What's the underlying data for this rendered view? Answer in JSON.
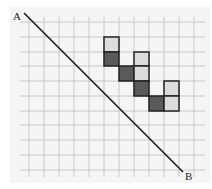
{
  "diagram": {
    "type": "grid-line-rasterization",
    "labels": {
      "start": "A",
      "end": "B"
    },
    "colors": {
      "background": "#ffffff",
      "panel": "#f5f5f5",
      "grid": "#c8c8c8",
      "line": "#1a1a1a",
      "cell_border": "#222222",
      "dark_cell": "#5a5a5a",
      "light_cell": "#dcdcdc"
    },
    "grid": {
      "x_lines": [
        29,
        44,
        59,
        74,
        89,
        104,
        119,
        134,
        149,
        164,
        179,
        194
      ],
      "y_lines": [
        22,
        37,
        52,
        66,
        81,
        96,
        111,
        125,
        140,
        155,
        170
      ],
      "x_extent": [
        20,
        205
      ],
      "y_extent": [
        17,
        177
      ]
    },
    "line": {
      "x1": 24,
      "y1": 13,
      "x2": 183,
      "y2": 172
    },
    "label_positions": {
      "start": {
        "x": 13,
        "y": 20
      },
      "end": {
        "x": 185,
        "y": 180
      }
    },
    "cells": [
      {
        "x": 104,
        "y": 37,
        "w": 15,
        "h": 15,
        "shade": "light"
      },
      {
        "x": 104,
        "y": 52,
        "w": 15,
        "h": 14,
        "shade": "dark"
      },
      {
        "x": 119,
        "y": 66,
        "w": 15,
        "h": 15,
        "shade": "dark"
      },
      {
        "x": 134,
        "y": 52,
        "w": 15,
        "h": 14,
        "shade": "light"
      },
      {
        "x": 134,
        "y": 66,
        "w": 15,
        "h": 15,
        "shade": "light"
      },
      {
        "x": 134,
        "y": 81,
        "w": 15,
        "h": 15,
        "shade": "dark"
      },
      {
        "x": 149,
        "y": 96,
        "w": 15,
        "h": 15,
        "shade": "dark"
      },
      {
        "x": 164,
        "y": 81,
        "w": 15,
        "h": 15,
        "shade": "light"
      },
      {
        "x": 164,
        "y": 96,
        "w": 15,
        "h": 15,
        "shade": "light"
      }
    ]
  }
}
